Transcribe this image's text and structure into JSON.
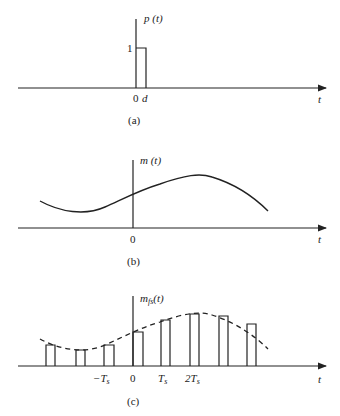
{
  "panel_a": {
    "ylabel": "p (t)",
    "xlabel": "t",
    "amplitude_label": "1",
    "tick_zero": "0",
    "tick_d": "d",
    "caption": "(a)"
  },
  "panel_b": {
    "ylabel": "m (t)",
    "xlabel": "t",
    "tick_zero": "0",
    "caption": "(b)"
  },
  "panel_c": {
    "ylabel_base": "m",
    "ylabel_sub": "fs",
    "ylabel_arg": "(t)",
    "xlabel": "t",
    "ticks": [
      "−T",
      "0",
      "T",
      "2T"
    ],
    "tick_sub": "s",
    "caption": "(c)"
  },
  "colors": {
    "line": "#222222",
    "background": "#ffffff"
  }
}
